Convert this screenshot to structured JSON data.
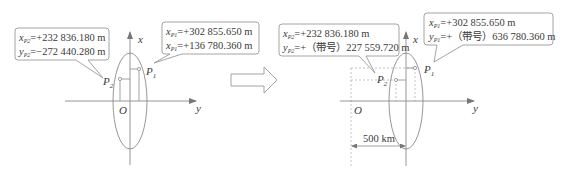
{
  "left_panel": {
    "callout_p2": {
      "line1_var": "x",
      "line1_sub": "P2",
      "line1_value": "=+232 836.180 m",
      "line2_var": "y",
      "line2_sub": "P2",
      "line2_value": "=−272 440.280 m"
    },
    "callout_p1": {
      "line1_var": "x",
      "line1_sub": "P1",
      "line1_value": "=+302 855.650 m",
      "line2_var": "x",
      "line2_sub": "P1",
      "line2_value": "=+136 780.360 m"
    },
    "axis_x_label": "x",
    "axis_y_label": "y",
    "origin_label": "O",
    "point_p1": {
      "main": "P",
      "sub": "1"
    },
    "point_p2": {
      "main": "P",
      "sub": "2"
    }
  },
  "transform_arrow": "right-arrow-icon",
  "right_panel": {
    "callout_p2": {
      "line1_var": "x",
      "line1_sub": "P2",
      "line1_value": "=+232 836.180 m",
      "line2_var": "y",
      "line2_sub": "P2",
      "line2_value": "=+（带号）227 559.720 m"
    },
    "callout_p1": {
      "line1_var": "x",
      "line1_sub": "P1",
      "line1_value": "=+302 855.650 m",
      "line2_var": "y",
      "line2_sub": "P1",
      "line2_value": "=+（带号）636 780.360 m"
    },
    "axis_x_label": "x",
    "axis_y_label": "y",
    "origin_label": "O",
    "point_p1": {
      "main": "P",
      "sub": "1"
    },
    "point_p2": {
      "main": "P",
      "sub": "2"
    },
    "offset_label": "500 km"
  },
  "colors": {
    "stroke": "#8a8a8a",
    "text": "#3a3a3a",
    "dashed": "#b0b0b0"
  }
}
